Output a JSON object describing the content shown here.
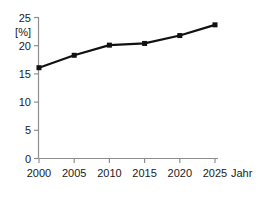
{
  "chart_data": {
    "type": "line",
    "title": "",
    "xlabel": "Jahr",
    "ylabel": "",
    "yunit": "[%]",
    "categories": [
      "2000",
      "2005",
      "2010",
      "2015",
      "2020",
      "2025"
    ],
    "x": [
      2000,
      2005,
      2010,
      2015,
      2020,
      2025
    ],
    "values": [
      16.1,
      18.3,
      20.1,
      20.4,
      21.8,
      23.7
    ],
    "series": [
      {
        "name": "",
        "values": [
          16.1,
          18.3,
          20.1,
          20.4,
          21.8,
          23.7
        ]
      }
    ],
    "xlim": [
      2000,
      2025
    ],
    "ylim": [
      0,
      25
    ],
    "yticks": [
      0,
      5,
      10,
      15,
      20,
      25
    ],
    "ytick_labels": [
      "0",
      "5",
      "10",
      "15",
      "20",
      "25"
    ],
    "xticks": [
      2000,
      2005,
      2010,
      2015,
      2020,
      2025
    ],
    "xtick_labels": [
      "2000",
      "2005",
      "2010",
      "2015",
      "2020",
      "2025"
    ],
    "grid": false,
    "legend": false,
    "legend_position": "none",
    "marker": "square",
    "line_color": "#111111",
    "marker_color": "#111111",
    "axis_color": "#8e8e8e",
    "background_color": "#ffffff"
  },
  "labels": {
    "y_0": "0",
    "y_5": "5",
    "y_10": "10",
    "y_15": "15",
    "y_20": "20",
    "y_25": "25",
    "unit": "[%]",
    "x_2000": "2000",
    "x_2005": "2005",
    "x_2010": "2010",
    "x_2015": "2015",
    "x_2020": "2020",
    "x_2025": "2025",
    "x_axis_name": "Jahr"
  }
}
